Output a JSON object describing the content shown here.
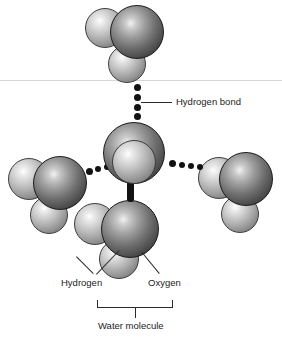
{
  "figure": {
    "background_color": "#ffffff"
  },
  "labels": {
    "hydrogen_bond": "Hydrogen bond",
    "hydrogen": "Hydrogen",
    "oxygen": "Oxygen",
    "water_molecule": "Water molecule"
  },
  "colors": {
    "oxygen_sphere": "#4a4a4a",
    "hydrogen_sphere": "#b0b0b0",
    "bond_dot": "#121212",
    "leader_line": "#2b2b2b",
    "surface_line": "#d8d8d8",
    "text": "#1c1c1c"
  },
  "molecules": [
    {
      "id": "top",
      "role": "donor-water-above",
      "atoms": [
        {
          "element": "Oxygen",
          "x": 110,
          "y": 5,
          "d": 54
        },
        {
          "element": "Hydrogen",
          "x": 85,
          "y": 8,
          "d": 40
        },
        {
          "element": "Hydrogen",
          "x": 108,
          "y": 45,
          "d": 38
        }
      ]
    },
    {
      "id": "center",
      "role": "central-water",
      "atoms": [
        {
          "element": "Oxygen",
          "x": 103,
          "y": 122,
          "d": 62
        },
        {
          "element": "Hydrogen",
          "x": 112,
          "y": 140,
          "d": 44
        }
      ]
    },
    {
      "id": "left",
      "role": "acceptor-water-left",
      "atoms": [
        {
          "element": "Oxygen",
          "x": 33,
          "y": 156,
          "d": 54
        },
        {
          "element": "Hydrogen",
          "x": 8,
          "y": 158,
          "d": 42
        },
        {
          "element": "Hydrogen",
          "x": 30,
          "y": 196,
          "d": 38
        }
      ]
    },
    {
      "id": "right",
      "role": "acceptor-water-right",
      "atoms": [
        {
          "element": "Oxygen",
          "x": 219,
          "y": 152,
          "d": 54
        },
        {
          "element": "Hydrogen",
          "x": 198,
          "y": 157,
          "d": 42
        },
        {
          "element": "Hydrogen",
          "x": 221,
          "y": 195,
          "d": 38
        }
      ]
    },
    {
      "id": "bottom",
      "role": "labelled-water-molecule",
      "atoms": [
        {
          "element": "Oxygen",
          "x": 101,
          "y": 200,
          "d": 58
        },
        {
          "element": "Hydrogen",
          "x": 74,
          "y": 203,
          "d": 42
        },
        {
          "element": "Hydrogen",
          "x": 99,
          "y": 239,
          "d": 40
        }
      ]
    }
  ],
  "hydrogen_bonds": [
    {
      "id": "top-to-center",
      "orientation": "vertical",
      "dots": [
        {
          "x": 134,
          "y": 84,
          "d": 7
        },
        {
          "x": 134,
          "y": 94,
          "d": 7
        },
        {
          "x": 134,
          "y": 104,
          "d": 7
        },
        {
          "x": 134,
          "y": 113,
          "d": 7
        }
      ]
    },
    {
      "id": "center-to-left",
      "orientation": "horizontal",
      "dots": [
        {
          "x": 86,
          "y": 168,
          "d": 7
        },
        {
          "x": 95,
          "y": 166,
          "d": 6
        },
        {
          "x": 104,
          "y": 164,
          "d": 6
        }
      ]
    },
    {
      "id": "center-to-right",
      "orientation": "horizontal",
      "dots": [
        {
          "x": 169,
          "y": 160,
          "d": 7
        },
        {
          "x": 179,
          "y": 162,
          "d": 6
        },
        {
          "x": 188,
          "y": 163,
          "d": 6
        },
        {
          "x": 197,
          "y": 164,
          "d": 6
        }
      ]
    },
    {
      "id": "center-to-bottom",
      "orientation": "stub",
      "stub": {
        "x": 127,
        "y": 181,
        "w": 7,
        "h": 21
      }
    }
  ],
  "annotations": {
    "hydrogen_bond_leader": {
      "x1": 141,
      "y1": 102,
      "x2": 172,
      "y2": 102
    },
    "hydrogen_leader_a": {
      "x1": 93,
      "y1": 274,
      "x2": 76,
      "y2": 257
    },
    "hydrogen_leader_b": {
      "x1": 96,
      "y1": 274,
      "x2": 119,
      "y2": 250
    },
    "oxygen_leader": {
      "x1": 159,
      "y1": 274,
      "x2": 141,
      "y2": 252
    },
    "bracket": {
      "x": 97,
      "y": 300,
      "w": 76,
      "h": 8
    },
    "bracket_stem": {
      "x": 135,
      "y": 308,
      "h": 10
    }
  },
  "surface_line": {
    "y": 80
  }
}
